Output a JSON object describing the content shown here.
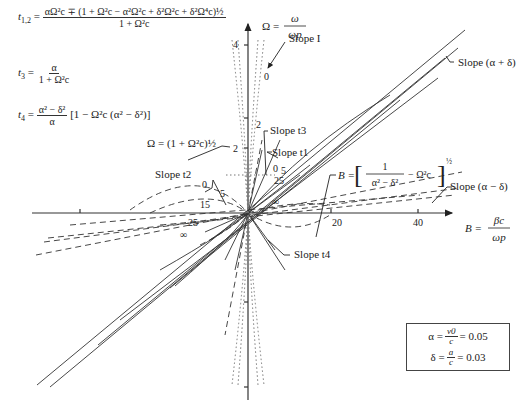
{
  "formulas": {
    "t12": {
      "lhs": "t",
      "lhs_sub": "1,2",
      "numerator": "αΩ²c ∓ (1 + Ω²c − α²Ω²c + δ²Ω²c + δ²Ω⁴c)½",
      "denominator": "1 + Ω²c"
    },
    "t3": {
      "lhs": "t",
      "lhs_sub": "3",
      "numerator": "α",
      "denominator": "1 + Ω²c"
    },
    "t4": {
      "lhs": "t",
      "lhs_sub": "4",
      "numerator": "α² − δ²",
      "denominator": "α",
      "bracket": "[1 − Ω²c (α² − δ²)]"
    }
  },
  "axes": {
    "y_label_lhs": "Ω =",
    "y_label_num": "ω",
    "y_label_den": "ωp",
    "x_label_lhs": "B =",
    "x_label_num": "βc",
    "x_label_den": "ωp",
    "y_ticks": [
      "4",
      "2",
      "2"
    ],
    "x_ticks": [
      "20",
      "40"
    ]
  },
  "annotations": {
    "slope_I": "Slope I",
    "slope_t3": "Slope t3",
    "slope_t1": "Slope t1",
    "slope_t2": "Slope t2",
    "slope_t4": "Slope t4",
    "slope_alpha_plus_delta": "Slope (α + δ)",
    "slope_alpha_minus_delta": "Slope (α − δ)",
    "omega_cutoff": "Ω = (1 + Ω²c)½",
    "b_formula_lhs": "B =",
    "b_formula_num": "1",
    "b_formula_den": "α² − δ²",
    "b_formula_tail": "− Ω²c",
    "b_formula_exp": "½"
  },
  "curve_labels": {
    "upper": [
      "0",
      "0",
      "5",
      "25",
      "∞"
    ],
    "left": [
      "0",
      "5",
      "15",
      "25",
      "∞"
    ]
  },
  "parameters": {
    "alpha_lhs": "α =",
    "alpha_num": "v0",
    "alpha_den": "c",
    "alpha_val": "= 0.05",
    "delta_lhs": "δ =",
    "delta_num": "a",
    "delta_den": "c",
    "delta_val": "= 0.03"
  }
}
